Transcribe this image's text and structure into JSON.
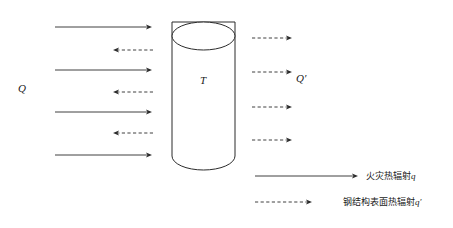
{
  "diagram": {
    "type": "heat-radiation-schematic",
    "canvas": {
      "width": 453,
      "height": 228,
      "background": "#ffffff"
    },
    "stroke_color": "#2b2b2b",
    "labels": {
      "incoming_heat": "Q",
      "outgoing_heat": "Q′",
      "cylinder_temperature": "T"
    },
    "cylinder": {
      "name": "steel-column",
      "left": 172,
      "right": 235,
      "top": 22,
      "bottom": 170,
      "ellipse_ry": 14
    },
    "incoming_solid_arrows": {
      "count": 4,
      "direction": "right",
      "style": "solid",
      "x_start": 55,
      "x_end": 152,
      "y_positions": [
        27,
        70,
        112,
        155
      ]
    },
    "reflected_dashed_arrows": {
      "count": 3,
      "direction": "left",
      "style": "dashed",
      "x_start": 153,
      "x_end": 113,
      "y_positions": [
        50,
        92,
        133
      ]
    },
    "emitted_dashed_arrows": {
      "count": 4,
      "direction": "right",
      "style": "dashed",
      "x_start": 252,
      "x_end": 292,
      "y_positions": [
        38,
        72,
        107,
        140
      ]
    },
    "legend": {
      "name": "legend",
      "entries": [
        {
          "style": "solid",
          "direction": "right",
          "x_start": 255,
          "x_end": 358,
          "y": 176,
          "text_x": 366,
          "label_prefix": "火灾热辐射",
          "label_symbol": "q"
        },
        {
          "style": "dashed",
          "direction": "right",
          "x_start": 255,
          "x_end": 312,
          "y": 202,
          "text_x": 343,
          "label_prefix": "钢结构表面热辐射",
          "label_symbol": "q′"
        }
      ]
    },
    "label_positions": {
      "Q": {
        "x": 18,
        "y": 92
      },
      "Q_prime": {
        "x": 296,
        "y": 82
      },
      "T": {
        "x": 200,
        "y": 84
      }
    }
  }
}
